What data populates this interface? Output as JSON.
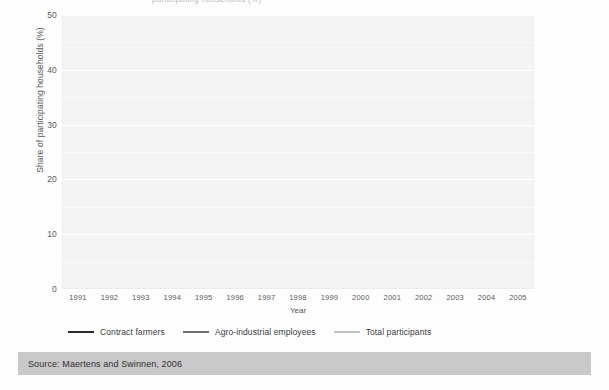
{
  "figure": {
    "top_clipped_text": "participating households (%)",
    "source_label": "Source: Maertens and Swinnen, 2006"
  },
  "chart_data": {
    "type": "line",
    "title": "",
    "xlabel": "Year",
    "ylabel": "Share of participating households (%)",
    "categories": [
      "1991",
      "1992",
      "1993",
      "1994",
      "1995",
      "1996",
      "1997",
      "1998",
      "1999",
      "2000",
      "2001",
      "2002",
      "2003",
      "2004",
      "2005"
    ],
    "x": [
      1991,
      1992,
      1993,
      1994,
      1995,
      1996,
      1997,
      1998,
      1999,
      2000,
      2001,
      2002,
      2003,
      2004,
      2005
    ],
    "xlim": [
      1991,
      2005
    ],
    "ylim": [
      0,
      50
    ],
    "yticks": [
      0,
      10,
      20,
      30,
      40,
      50
    ],
    "grid": true,
    "legend_position": "below-axes",
    "series": [
      {
        "name": "Contract farmers",
        "color": "#2b2b2b",
        "values": [
          6.0,
          6.1,
          9.6,
          10.6,
          12.4,
          11.1,
          12.8,
          13.4,
          17.6,
          22.9,
          21.5,
          19.8,
          20.2,
          11.6,
          10.4
        ]
      },
      {
        "name": "Agro-industrial employees",
        "color": "#6e6e6e",
        "values": [
          2.5,
          2.5,
          2.6,
          3.5,
          5.4,
          5.7,
          5.8,
          6.1,
          6.2,
          6.8,
          13.5,
          20.3,
          26.5,
          31.4,
          32.3
        ]
      },
      {
        "name": "Total participants",
        "color": "#c2c2c2",
        "values": [
          8.6,
          8.7,
          12.2,
          14.1,
          15.6,
          15.7,
          17.3,
          17.7,
          22.2,
          27.8,
          32.8,
          35.0,
          37.6,
          38.8,
          39.6
        ]
      }
    ]
  }
}
